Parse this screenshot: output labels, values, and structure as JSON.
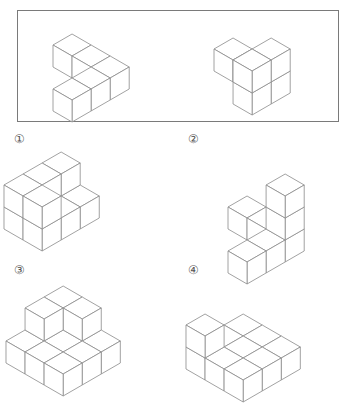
{
  "page": {
    "kind": "multiple-choice-spatial-reasoning-figure",
    "background_color": "#ffffff",
    "line_color": "#8a8a8a",
    "face_color": "#ffffff",
    "border_color": "#7a7a7a",
    "label_color": "#555555",
    "width": 355,
    "height": 348
  },
  "prompt": {
    "name": "prompt-box",
    "border_color": "#7a7a7a",
    "figures": [
      {
        "name": "prompt-figure-left",
        "description": "L-shaped / V-shaped flat arrangement of 5 unit cubes, one layer high",
        "cube_size": 22,
        "origin_x": 72,
        "origin_y": 56,
        "cubes": [
          {
            "x": 0,
            "y": 0,
            "z": 0
          },
          {
            "x": 1,
            "y": 0,
            "z": 0
          },
          {
            "x": 2,
            "y": 0,
            "z": 0
          },
          {
            "x": 2,
            "y": 1,
            "z": 0
          },
          {
            "x": 2,
            "y": 2,
            "z": 0
          }
        ]
      },
      {
        "name": "prompt-figure-right",
        "description": "Row of three unit cubes with one cube stacked on the far end",
        "cube_size": 22,
        "origin_x": 233,
        "origin_y": 60,
        "cubes": [
          {
            "x": 0,
            "y": 0,
            "z": 0
          },
          {
            "x": 1,
            "y": 0,
            "z": 0
          },
          {
            "x": 2,
            "y": 0,
            "z": 0
          },
          {
            "x": 2,
            "y": 0,
            "z": 1
          },
          {
            "x": 2,
            "y": 1,
            "z": 0
          },
          {
            "x": 2,
            "y": 1,
            "z": 1
          }
        ]
      }
    ]
  },
  "options": [
    {
      "id": "option-1",
      "label": "①",
      "label_x": 14,
      "label_y": 133,
      "figure": {
        "name": "option-1-figure",
        "description": "Two-layer block assembly, roughly a 2x2x2 cluster with notches",
        "cube_size": 22,
        "origin_x": 61,
        "origin_y": 196,
        "cubes": [
          {
            "x": 0,
            "y": 0,
            "z": 0
          },
          {
            "x": 1,
            "y": 0,
            "z": 0
          },
          {
            "x": 0,
            "y": 1,
            "z": 0
          },
          {
            "x": 1,
            "y": 1,
            "z": 0
          },
          {
            "x": 0,
            "y": 2,
            "z": 0
          },
          {
            "x": 1,
            "y": 2,
            "z": 0
          },
          {
            "x": 0,
            "y": 0,
            "z": 1
          },
          {
            "x": 0,
            "y": 1,
            "z": 1
          },
          {
            "x": 0,
            "y": 2,
            "z": 1
          },
          {
            "x": 1,
            "y": 2,
            "z": 1
          }
        ]
      }
    },
    {
      "id": "option-2",
      "label": "②",
      "label_x": 188,
      "label_y": 133,
      "figure": {
        "name": "option-2-figure",
        "description": "Cross / T shaped arrangement with a two-cube vertical stack at the centre",
        "cube_size": 22,
        "origin_x": 247,
        "origin_y": 218,
        "cubes": [
          {
            "x": 0,
            "y": 0,
            "z": 0
          },
          {
            "x": 1,
            "y": 0,
            "z": 0
          },
          {
            "x": 2,
            "y": 0,
            "z": 0
          },
          {
            "x": 2,
            "y": 1,
            "z": 0
          },
          {
            "x": 2,
            "y": 2,
            "z": 0
          },
          {
            "x": 2,
            "y": 0,
            "z": 1
          },
          {
            "x": 2,
            "y": 0,
            "z": 2
          }
        ]
      }
    },
    {
      "id": "option-3",
      "label": "③",
      "label_x": 14,
      "label_y": 264,
      "figure": {
        "name": "option-3-figure",
        "description": "Wide stepped / staircase slab of cubes, cropped by the bottom edge of the image",
        "cube_size": 22,
        "origin_x": 63,
        "origin_y": 330,
        "cubes": [
          {
            "x": 0,
            "y": 0,
            "z": 0
          },
          {
            "x": 1,
            "y": 0,
            "z": 0
          },
          {
            "x": 2,
            "y": 0,
            "z": 0
          },
          {
            "x": 0,
            "y": 1,
            "z": 0
          },
          {
            "x": 1,
            "y": 1,
            "z": 0
          },
          {
            "x": 2,
            "y": 1,
            "z": 0
          },
          {
            "x": 0,
            "y": 2,
            "z": 0
          },
          {
            "x": 1,
            "y": 2,
            "z": 0
          },
          {
            "x": 2,
            "y": 2,
            "z": 0
          },
          {
            "x": 0,
            "y": 0,
            "z": 1
          },
          {
            "x": 1,
            "y": 0,
            "z": 1
          },
          {
            "x": 0,
            "y": 1,
            "z": 1
          }
        ]
      }
    },
    {
      "id": "option-4",
      "label": "④",
      "label_x": 188,
      "label_y": 264,
      "figure": {
        "name": "option-4-figure",
        "description": "Wide slab of cubes with a single cube raised at the rear corner, cropped by the bottom edge",
        "cube_size": 22,
        "origin_x": 243,
        "origin_y": 336,
        "cubes": [
          {
            "x": 0,
            "y": 0,
            "z": 0
          },
          {
            "x": 1,
            "y": 0,
            "z": 0
          },
          {
            "x": 2,
            "y": 0,
            "z": 0
          },
          {
            "x": 0,
            "y": 1,
            "z": 0
          },
          {
            "x": 1,
            "y": 1,
            "z": 0
          },
          {
            "x": 2,
            "y": 1,
            "z": 0
          },
          {
            "x": 0,
            "y": 2,
            "z": 0
          },
          {
            "x": 1,
            "y": 2,
            "z": 0
          },
          {
            "x": 2,
            "y": 2,
            "z": 0
          },
          {
            "x": 0,
            "y": 2,
            "z": 1
          }
        ]
      }
    }
  ]
}
